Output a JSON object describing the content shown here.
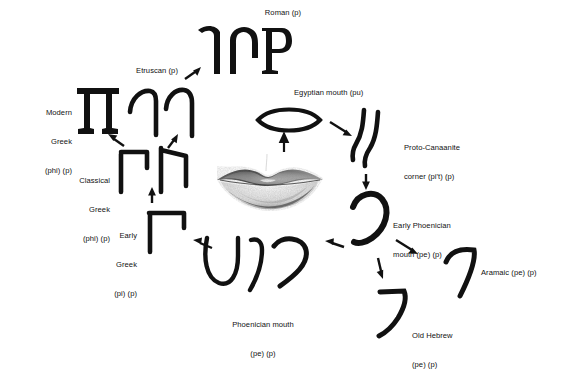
{
  "diagram": {
    "background_color": "#ffffff",
    "ink_color": "#111111",
    "center": {
      "name": "human-mouth-photo",
      "description": "grayscale halftone photograph of human lips"
    },
    "nodes": [
      {
        "id": "roman",
        "label_lines": [
          "Roman (p)"
        ],
        "align": "center",
        "label_x": 283,
        "label_y": 8,
        "glyph_x": 196,
        "glyph_y": 24,
        "glyph_w": 96,
        "glyph_h": 52,
        "style": "serif-capitals",
        "forms": 3
      },
      {
        "id": "etruscan",
        "label_lines": [
          "Etruscan (p)"
        ],
        "align": "center",
        "label_x": 157,
        "label_y": 66,
        "glyph_x": 127,
        "glyph_y": 86,
        "glyph_w": 70,
        "glyph_h": 52,
        "style": "brush-hook",
        "forms": 2
      },
      {
        "id": "modern-greek",
        "label_lines": [
          "Modern",
          "Greek",
          "(phi) (p)"
        ],
        "align": "right",
        "label_x": 72,
        "label_y": 89,
        "glyph_x": 76,
        "glyph_y": 86,
        "glyph_w": 44,
        "glyph_h": 50,
        "style": "serif-pi",
        "forms": 1
      },
      {
        "id": "classical-greek",
        "label_lines": [
          "Classical",
          "Greek",
          "(phi) (p)"
        ],
        "align": "right",
        "label_x": 110,
        "label_y": 157,
        "glyph_x": 117,
        "glyph_y": 146,
        "glyph_w": 74,
        "glyph_h": 48,
        "style": "brush-pi",
        "forms": 2
      },
      {
        "id": "early-greek",
        "label_lines": [
          "Early",
          "Greek",
          "(pi) (p)"
        ],
        "align": "right",
        "label_x": 137,
        "label_y": 212,
        "glyph_x": 146,
        "glyph_y": 208,
        "glyph_w": 46,
        "glyph_h": 46,
        "style": "brush-pi-short",
        "forms": 1
      },
      {
        "id": "phoenician-mouth",
        "label_lines": [
          "Phoenician mouth",
          "(pe) (p)"
        ],
        "align": "center",
        "label_x": 263,
        "label_y": 301,
        "glyph_x": 198,
        "glyph_y": 236,
        "glyph_w": 118,
        "glyph_h": 60,
        "style": "curved-strokes",
        "forms": 3
      },
      {
        "id": "old-hebrew",
        "label_lines": [
          "Old Hebrew",
          "(pe) (p)"
        ],
        "align": "left",
        "label_x": 412,
        "label_y": 312,
        "glyph_x": 378,
        "glyph_y": 288,
        "glyph_w": 34,
        "glyph_h": 52,
        "style": "brush-hook",
        "forms": 1
      },
      {
        "id": "aramaic",
        "label_lines": [
          "Aramaic (pe) (p)"
        ],
        "align": "left",
        "label_x": 481,
        "label_y": 268,
        "glyph_x": 444,
        "glyph_y": 248,
        "glyph_w": 36,
        "glyph_h": 52,
        "style": "brush-hook",
        "forms": 1
      },
      {
        "id": "early-phoenician",
        "label_lines": [
          "Early Phoenician",
          "mouth (pe) (p)"
        ],
        "align": "left",
        "label_x": 393,
        "label_y": 202,
        "glyph_x": 350,
        "glyph_y": 190,
        "glyph_w": 40,
        "glyph_h": 56,
        "style": "open-loop",
        "forms": 1
      },
      {
        "id": "proto-canaanite",
        "label_lines": [
          "Proto-Canaanite",
          "corner (pi't) (p)"
        ],
        "align": "left",
        "label_x": 404,
        "label_y": 124,
        "glyph_x": 352,
        "glyph_y": 108,
        "glyph_w": 40,
        "glyph_h": 62,
        "style": "double-bend",
        "forms": 2
      },
      {
        "id": "egyptian-mouth",
        "label_lines": [
          "Egyptian mouth (pu)"
        ],
        "align": "left",
        "label_x": 294,
        "label_y": 88,
        "glyph_x": 255,
        "glyph_y": 102,
        "glyph_w": 68,
        "glyph_h": 36,
        "style": "lens-outline",
        "forms": 1
      }
    ],
    "arrows": [
      {
        "id": "mouth-to-egyptian",
        "from": "human-mouth-photo",
        "to": "egyptian-mouth"
      },
      {
        "id": "egyptian-to-proto-canaanite",
        "from": "egyptian-mouth",
        "to": "proto-canaanite"
      },
      {
        "id": "proto-canaanite-to-early-phoenician",
        "from": "proto-canaanite",
        "to": "early-phoenician"
      },
      {
        "id": "early-phoenician-to-aramaic",
        "from": "early-phoenician",
        "to": "aramaic"
      },
      {
        "id": "early-phoenician-to-old-hebrew",
        "from": "early-phoenician",
        "to": "old-hebrew"
      },
      {
        "id": "early-phoenician-to-phoenician-mouth",
        "from": "early-phoenician",
        "to": "phoenician-mouth"
      },
      {
        "id": "phoenician-mouth-to-early-greek",
        "from": "phoenician-mouth",
        "to": "early-greek"
      },
      {
        "id": "early-greek-to-classical-greek",
        "from": "early-greek",
        "to": "classical-greek"
      },
      {
        "id": "classical-greek-to-modern-greek",
        "from": "classical-greek",
        "to": "modern-greek"
      },
      {
        "id": "classical-greek-to-etruscan",
        "from": "classical-greek",
        "to": "etruscan"
      },
      {
        "id": "etruscan-to-roman",
        "from": "etruscan",
        "to": "roman"
      }
    ]
  }
}
